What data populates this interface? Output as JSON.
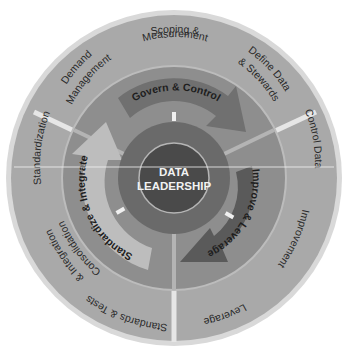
{
  "diagram": {
    "title": "DATA LEADERSHIP",
    "center": {
      "line1": "DATA",
      "line2": "LEADERSHIP"
    },
    "cycle_arrows": [
      {
        "label": "Govern & Control"
      },
      {
        "label": "Improve & Leverage"
      },
      {
        "label": "Standardize & Integrate"
      }
    ],
    "outer_sectors": [
      {
        "name": "govern",
        "items": [
          "Demand Management",
          "Scoping & Measurement",
          "Define Data & Stewards"
        ]
      },
      {
        "name": "improve",
        "items": [
          "Control Data",
          "Improvement",
          "Leverage"
        ]
      },
      {
        "name": "standardize",
        "items": [
          "Standards & Tests",
          "Consolidation & Integration",
          "Standardization"
        ]
      }
    ],
    "labels": {
      "demand_1": "Demand",
      "demand_2": "Management",
      "scoping_1": "Scoping &",
      "scoping_2": "Measurement",
      "define_1": "Define Data",
      "define_2": "& Stewards",
      "control_data": "Control Data",
      "improvement": "Improvement",
      "leverage": "Leverage",
      "standards_tests": "Standards & Tests",
      "consolidation_1": "Consolidation",
      "consolidation_2": "& Integration",
      "standardization": "Standardization"
    },
    "colors": {
      "background": "#ffffff",
      "outer_halo": "#d9d9d9",
      "outer_ring": "#a9a9a9",
      "separator": "#e8e8e8",
      "middle_ring": "#8e8e8e",
      "arrow_govern": "#707070",
      "arrow_improve": "#5e5e5e",
      "arrow_standardize": "#bdbdbd",
      "inner_ring": "#6a6a6a",
      "center": "#4a4a4a",
      "center_stroke": "#b5b5b5"
    }
  }
}
